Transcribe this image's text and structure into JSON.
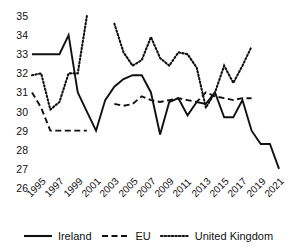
{
  "chart_data": {
    "type": "line",
    "title": "",
    "xlabel": "",
    "ylabel": "",
    "xlim": [
      1995,
      2021
    ],
    "ylim": [
      26,
      35
    ],
    "grid": false,
    "legend_position": "bottom",
    "y_ticks": [
      "35",
      "34",
      "33",
      "32",
      "31",
      "30",
      "29",
      "28",
      "27",
      "26"
    ],
    "x_ticks": [
      "1995",
      "1997",
      "1999",
      "2001",
      "2003",
      "2005",
      "2007",
      "2009",
      "2011",
      "2013",
      "2015",
      "2017",
      "2019",
      "2021"
    ],
    "note": "All three series have a data gap between 2001 and 2003",
    "series": [
      {
        "name": "Ireland",
        "style": "solid",
        "color": "#111111",
        "points": [
          [
            1995,
            33.0
          ],
          [
            1996,
            33.0
          ],
          [
            1997,
            33.0
          ],
          [
            1998,
            33.0
          ],
          [
            1999,
            34.0
          ],
          [
            2000,
            31.0
          ],
          [
            2001,
            30.0
          ],
          [
            2002,
            29.0
          ],
          [
            2003,
            30.6
          ],
          [
            2004,
            31.3
          ],
          [
            2005,
            31.7
          ],
          [
            2006,
            31.9
          ],
          [
            2007,
            31.9
          ],
          [
            2008,
            31.0
          ],
          [
            2009,
            28.8
          ],
          [
            2010,
            30.5
          ],
          [
            2011,
            30.7
          ],
          [
            2012,
            29.8
          ],
          [
            2013,
            30.5
          ],
          [
            2014,
            30.4
          ],
          [
            2015,
            31.0
          ],
          [
            2016,
            29.7
          ],
          [
            2017,
            29.7
          ],
          [
            2018,
            30.6
          ],
          [
            2019,
            29.0
          ],
          [
            2020,
            28.3
          ],
          [
            2021,
            28.3
          ],
          [
            2022,
            27.0
          ]
        ]
      },
      {
        "name": "EU",
        "style": "dashed",
        "color": "#111111",
        "points": [
          [
            1995,
            31.0
          ],
          [
            1996,
            30.2
          ],
          [
            1997,
            29.0
          ],
          [
            1998,
            29.0
          ],
          [
            1999,
            29.0
          ],
          [
            2000,
            29.0
          ],
          [
            2001,
            29.0
          ],
          [
            2004,
            30.4
          ],
          [
            2005,
            30.3
          ],
          [
            2006,
            30.4
          ],
          [
            2007,
            30.8
          ],
          [
            2008,
            30.6
          ],
          [
            2009,
            30.5
          ],
          [
            2010,
            30.6
          ],
          [
            2011,
            30.7
          ],
          [
            2012,
            30.6
          ],
          [
            2013,
            30.5
          ],
          [
            2014,
            31.0
          ],
          [
            2015,
            30.8
          ],
          [
            2016,
            30.7
          ],
          [
            2017,
            30.6
          ],
          [
            2018,
            30.7
          ],
          [
            2019,
            30.7
          ]
        ]
      },
      {
        "name": "United Kingdom",
        "style": "dotted",
        "color": "#111111",
        "points": [
          [
            1995,
            31.9
          ],
          [
            1996,
            32.0
          ],
          [
            1997,
            30.1
          ],
          [
            1998,
            30.5
          ],
          [
            1999,
            32.0
          ],
          [
            2000,
            32.0
          ],
          [
            2001,
            35.0
          ],
          [
            2004,
            34.6
          ],
          [
            2005,
            33.1
          ],
          [
            2006,
            32.4
          ],
          [
            2007,
            32.7
          ],
          [
            2008,
            33.9
          ],
          [
            2009,
            32.8
          ],
          [
            2010,
            32.4
          ],
          [
            2011,
            33.1
          ],
          [
            2012,
            33.0
          ],
          [
            2013,
            32.3
          ],
          [
            2014,
            30.2
          ],
          [
            2015,
            31.0
          ],
          [
            2016,
            32.4
          ],
          [
            2017,
            31.5
          ],
          [
            2018,
            32.4
          ],
          [
            2019,
            33.4
          ]
        ]
      }
    ]
  },
  "legend": {
    "items": [
      {
        "label": "Ireland",
        "style": "solid"
      },
      {
        "label": "EU",
        "style": "dashed"
      },
      {
        "label": "United Kingdom",
        "style": "dotted"
      }
    ]
  }
}
